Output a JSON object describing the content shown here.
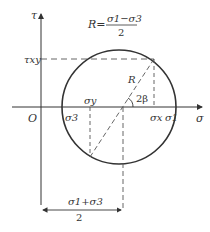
{
  "diagram": {
    "axes": {
      "x_label": "σ",
      "y_label": "τ",
      "origin_label": "O"
    },
    "formulas": {
      "radius": {
        "lhs": "R=",
        "numerator": "σ1−σ3",
        "denominator": "2"
      },
      "center": {
        "numerator": "σ1+σ3",
        "denominator": "2"
      }
    },
    "labels": {
      "tau_xy": "τxy",
      "sigma_y": "σy",
      "sigma_x": "σx",
      "sigma_1": "σ1",
      "sigma_3": "σ3",
      "radius": "R",
      "angle": "2β"
    },
    "colors": {
      "line": "#333333",
      "background": "#ffffff"
    }
  }
}
